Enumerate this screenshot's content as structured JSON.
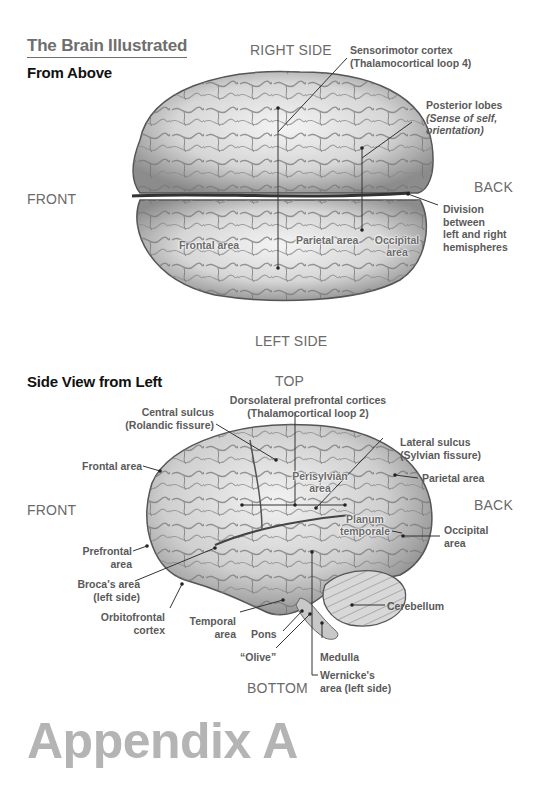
{
  "page": {
    "section_title": "The Brain Illustrated",
    "footer_heading": "Appendix A"
  },
  "top_view": {
    "subtitle": "From Above",
    "orientation": {
      "top": "RIGHT SIDE",
      "bottom": "LEFT SIDE",
      "left": "FRONT",
      "right": "BACK"
    },
    "callouts": {
      "sensorimotor_line1": "Sensorimotor cortex",
      "sensorimotor_line2": "(Thalamocortical loop 4)",
      "posterior_line1": "Posterior lobes",
      "posterior_line2": "(Sense of self,",
      "posterior_line3": "orientation)",
      "division_line1": "Division",
      "division_line2": "between",
      "division_line3": "left and right",
      "division_line4": "hemispheres"
    },
    "inline_labels": {
      "frontal": "Frontal area",
      "parietal": "Parietal area",
      "occipital_line1": "Occipital",
      "occipital_line2": "area"
    }
  },
  "side_view": {
    "subtitle": "Side View from Left",
    "orientation": {
      "top": "TOP",
      "bottom": "BOTTOM",
      "left": "FRONT",
      "right": "BACK"
    },
    "callouts": {
      "dlpfc_line1": "Dorsolateral prefrontal cortices",
      "dlpfc_line2": "(Thalamocortical loop 2)",
      "central_line1": "Central sulcus",
      "central_line2": "(Rolandic fissure)",
      "lateral_line1": "Lateral sulcus",
      "lateral_line2": "(Sylvian fissure)",
      "frontal": "Frontal area",
      "parietal": "Parietal area",
      "occipital_line1": "Occipital",
      "occipital_line2": "area",
      "prefrontal_line1": "Prefrontal",
      "prefrontal_line2": "area",
      "broca_line1": "Broca's area",
      "broca_line2": "(left side)",
      "orbitofrontal_line1": "Orbitofrontal",
      "orbitofrontal_line2": "cortex",
      "temporal_line1": "Temporal",
      "temporal_line2": "area",
      "pons": "Pons",
      "olive": "“Olive”",
      "medulla": "Medulla",
      "cerebellum": "Cerebellum",
      "wernicke_line1": "Wernicke's",
      "wernicke_line2": "area (left side)"
    },
    "inline_labels": {
      "perisylvian_line1": "Perisylvian",
      "perisylvian_line2": "area",
      "planum_line1": "Planum",
      "planum_line2": "temporale"
    }
  }
}
